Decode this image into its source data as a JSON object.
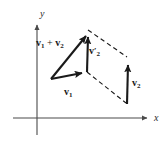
{
  "figure": {
    "background_color": "#ffffff",
    "ink_color": "#1a1a1a",
    "axis_color": "#4a4a4a"
  },
  "axes": {
    "y_label": "y",
    "x_label": "x",
    "origin": {
      "x": 37,
      "y": 118
    },
    "x_axis": {
      "x1": 13,
      "y1": 118,
      "x2": 150,
      "y2": 118,
      "arrow": "right"
    },
    "y_axis": {
      "x1": 37,
      "y1": 135,
      "x2": 37,
      "y2": 22,
      "arrow": "up"
    }
  },
  "labels": {
    "sum": {
      "base": "v",
      "sub": "1",
      "op": " + ",
      "base2": "v",
      "sub2": "2"
    },
    "v1": {
      "base": "v",
      "sub": "1"
    },
    "v2_prime": {
      "base": "v",
      "prime": "′",
      "sub": "2"
    },
    "v2": {
      "base": "v",
      "sub": "2"
    }
  },
  "geometry": {
    "tail": {
      "x": 51,
      "y": 79
    },
    "v1_tip": {
      "x": 87,
      "y": 72
    },
    "apex": {
      "x": 88,
      "y": 30
    },
    "v2_tip": {
      "x": 128,
      "y": 58
    },
    "v2_tail": {
      "x": 127,
      "y": 104
    }
  },
  "elements": {
    "solid_vectors": [
      {
        "name": "vector-v1",
        "from": "tail",
        "to": "v1_tip"
      },
      {
        "name": "vector-sum",
        "from": "tail",
        "to": "apex"
      },
      {
        "name": "vector-v2-prime",
        "from": "v1_tip",
        "to": "apex"
      },
      {
        "name": "vector-v2",
        "from": "v2_tail",
        "to": "v2_tip"
      }
    ],
    "dashed_lines": [
      {
        "name": "dashed-apex-to-v2tip",
        "from": "apex",
        "to": "v2_tip"
      },
      {
        "name": "dashed-v1tip-to-v2tail",
        "from": "v1_tip",
        "to": "v2_tail"
      }
    ]
  }
}
